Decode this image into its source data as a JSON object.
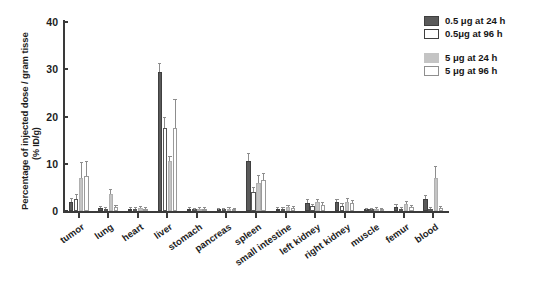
{
  "chart_data": {
    "type": "bar",
    "title": "",
    "xlabel": "",
    "ylabel": "Percentage of injected dose / gram tisse",
    "ylabel_sub": "(% ID/g)",
    "ylim": [
      0,
      40
    ],
    "yticks": [
      0,
      10,
      20,
      30,
      40
    ],
    "grid": false,
    "legend_position": "top-right",
    "categories": [
      "tumor",
      "lung",
      "heart",
      "liver",
      "stomach",
      "pancreas",
      "spleen",
      "small intestine",
      "left kidney",
      "right kidney",
      "muscle",
      "femur",
      "blood"
    ],
    "series": [
      {
        "name": "0.5 μg at 24 h",
        "color": "#5a5a5a",
        "values": [
          2.0,
          0.6,
          0.5,
          29.5,
          0.4,
          0.3,
          10.5,
          0.4,
          1.8,
          1.9,
          0.3,
          0.9,
          2.5
        ],
        "errors": [
          0.5,
          0.3,
          0.2,
          1.6,
          0.2,
          0.2,
          1.6,
          0.2,
          0.5,
          0.5,
          0.2,
          0.3,
          0.6
        ]
      },
      {
        "name": "0.5μg at 96 h",
        "color": "#ffffff",
        "values": [
          2.6,
          0.5,
          0.4,
          17.6,
          0.3,
          0.3,
          4.0,
          0.4,
          1.0,
          1.1,
          0.2,
          0.4,
          0.5
        ],
        "errors": [
          0.8,
          0.2,
          0.2,
          2.0,
          0.2,
          0.1,
          0.9,
          0.2,
          0.3,
          0.3,
          0.1,
          0.2,
          0.2
        ]
      },
      {
        "name": "5 μg at 24 h",
        "color": "#c4c4c4",
        "values": [
          7.0,
          3.5,
          0.6,
          10.5,
          0.5,
          0.4,
          6.0,
          0.8,
          1.9,
          2.0,
          0.4,
          1.4,
          7.0
        ],
        "errors": [
          3.1,
          1.0,
          0.3,
          1.0,
          0.2,
          0.2,
          1.5,
          0.3,
          0.5,
          0.6,
          0.2,
          0.5,
          2.4
        ]
      },
      {
        "name": "5 μg at 96 h",
        "color": "#ffffff",
        "values": [
          7.4,
          0.8,
          0.5,
          17.5,
          0.4,
          0.3,
          6.5,
          0.6,
          1.3,
          1.6,
          0.3,
          0.8,
          0.6
        ],
        "errors": [
          2.9,
          0.3,
          0.2,
          6.0,
          0.2,
          0.1,
          1.3,
          0.2,
          0.4,
          0.5,
          0.1,
          0.3,
          0.3
        ]
      }
    ]
  },
  "legend": {
    "groups": [
      {
        "entries": [
          {
            "swatch": "s0",
            "label": "0.5 μg at 24 h"
          },
          {
            "swatch": "s1",
            "label": "0.5μg at 96 h"
          }
        ]
      },
      {
        "entries": [
          {
            "swatch": "s2",
            "label": "5 μg at 24 h"
          },
          {
            "swatch": "s3",
            "label": "5 μg at 96 h"
          }
        ]
      }
    ]
  }
}
